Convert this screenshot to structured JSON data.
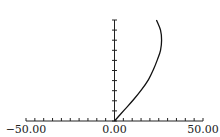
{
  "chart_data": {
    "type": "line",
    "title": "",
    "xlabel": "",
    "ylabel": "",
    "xlim": [
      -50,
      50
    ],
    "ylim": [
      0,
      10
    ],
    "x_tick_labels": [
      "-50.00",
      "0.00",
      "50.00"
    ],
    "x_tick_label_values": [
      -50,
      0,
      50
    ],
    "x_minor_tick_step": 5,
    "y_tick_step": 1,
    "y_tick_labels": [],
    "grid": false,
    "legend": "none",
    "series": [
      {
        "name": "curve",
        "x": [
          0,
          5.6,
          10.7,
          15.3,
          19.2,
          22.0,
          24.3,
          26.0,
          26.6,
          26.0,
          23.7
        ],
        "y": [
          0,
          1.1,
          2.1,
          3.1,
          4.1,
          5.1,
          6.1,
          7.0,
          8.0,
          9.0,
          10.0
        ]
      }
    ]
  }
}
